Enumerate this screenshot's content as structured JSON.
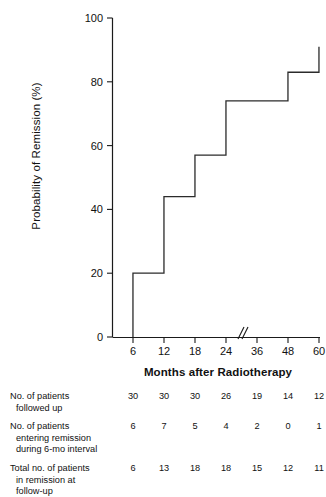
{
  "chart_data": {
    "type": "line",
    "title": "",
    "subtitle": "",
    "xlabel": "Months after Radiotherapy",
    "ylabel": "Probability of Remission (%)",
    "xlim": [
      0,
      66
    ],
    "ylim": [
      0,
      100
    ],
    "grid": false,
    "legend": null,
    "x_ticks": [
      6,
      12,
      18,
      24,
      36,
      48,
      60
    ],
    "x_tick_labels": [
      "6",
      "12",
      "18",
      "24",
      "36",
      "48",
      "60"
    ],
    "y_ticks": [
      0,
      20,
      40,
      60,
      80,
      100
    ],
    "y_tick_labels": [
      "0",
      "20",
      "40",
      "60",
      "80",
      "100"
    ],
    "axis_break": {
      "between": [
        24,
        36
      ],
      "symbol": "//",
      "note": "x-axis break between 24 and 36 months"
    },
    "series": [
      {
        "name": "Probability of Remission",
        "style": "step-post",
        "x": [
          6,
          6,
          12,
          12,
          18,
          18,
          24,
          24,
          48,
          48,
          60,
          60
        ],
        "y": [
          0,
          20,
          20,
          44,
          44,
          57,
          57,
          74,
          74,
          83,
          83,
          91
        ],
        "steps": [
          {
            "month": 6,
            "probability": 20
          },
          {
            "month": 12,
            "probability": 44
          },
          {
            "month": 18,
            "probability": 57
          },
          {
            "month": 24,
            "probability": 74
          },
          {
            "month": 48,
            "probability": 83
          },
          {
            "month": 60,
            "probability": 91
          }
        ]
      }
    ]
  },
  "axis": {
    "y_label": "Probability of Remission (%)",
    "x_label": "Months after Radiotherapy"
  },
  "table": {
    "columns": [
      "6",
      "12",
      "18",
      "24",
      "36",
      "48",
      "60"
    ],
    "rows": [
      {
        "label_line1": "No. of patients",
        "label_line2": "followed up",
        "label_line3": "",
        "values": [
          "30",
          "30",
          "30",
          "26",
          "19",
          "14",
          "12"
        ]
      },
      {
        "label_line1": "No. of patients",
        "label_line2": "entering remission",
        "label_line3": "during 6-mo interval",
        "values": [
          "6",
          "7",
          "5",
          "4",
          "2",
          "0",
          "1"
        ]
      },
      {
        "label_line1": "Total no. of patients",
        "label_line2": "in remission at",
        "label_line3": "follow-up",
        "values": [
          "6",
          "13",
          "18",
          "18",
          "15",
          "12",
          "11"
        ]
      }
    ]
  },
  "colors": {
    "line": "#2b2b2b",
    "axis": "#1a1a1a",
    "text": "#111111",
    "background": "#ffffff"
  }
}
